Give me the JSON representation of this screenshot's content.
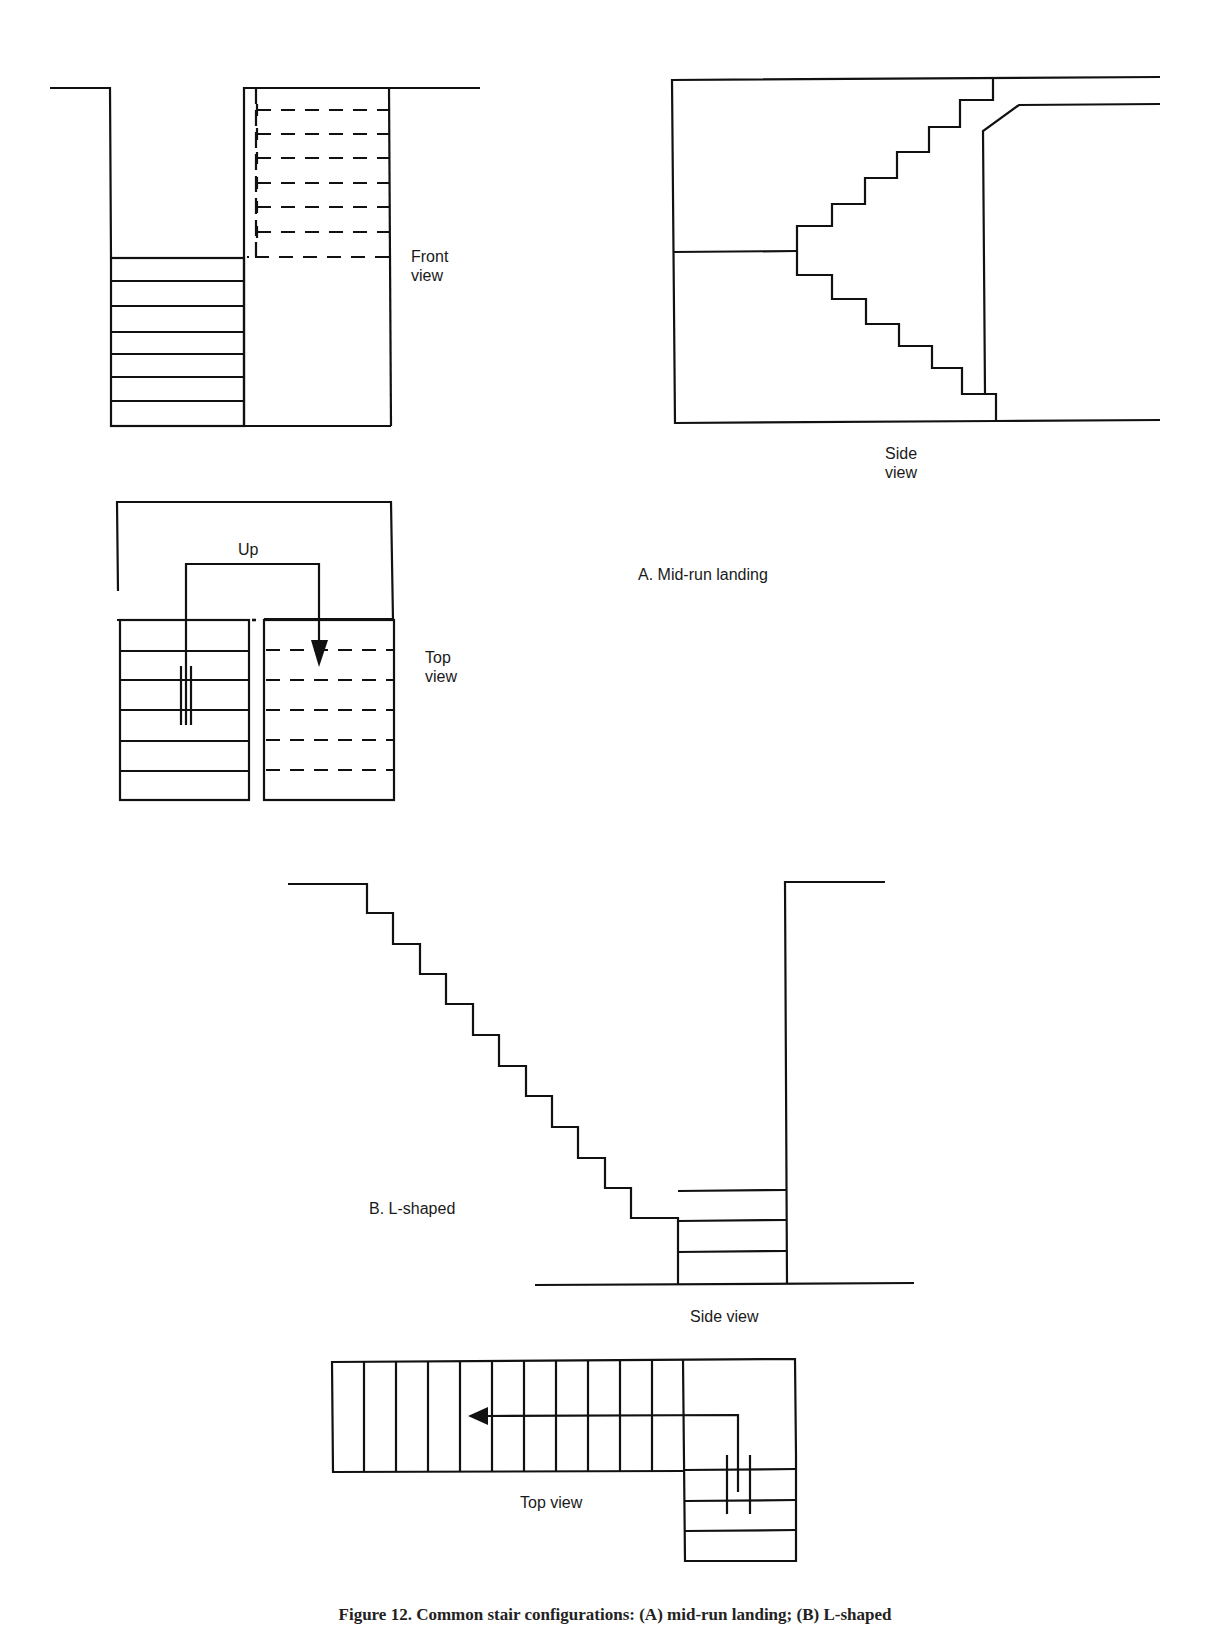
{
  "figure": {
    "section_a": {
      "title": "A. Mid-run landing",
      "front_view_label": "Front\nview",
      "side_view_label": "Side\nview",
      "top_view_label": "Top\nview",
      "direction_label": "Up"
    },
    "section_b": {
      "title": "B. L-shaped",
      "side_view_label": "Side view",
      "top_view_label": "Top view"
    },
    "caption": "Figure 12. Common stair configurations: (A) mid-run landing; (B) L-shaped"
  },
  "colors": {
    "line": "#111111",
    "background": "#ffffff"
  }
}
